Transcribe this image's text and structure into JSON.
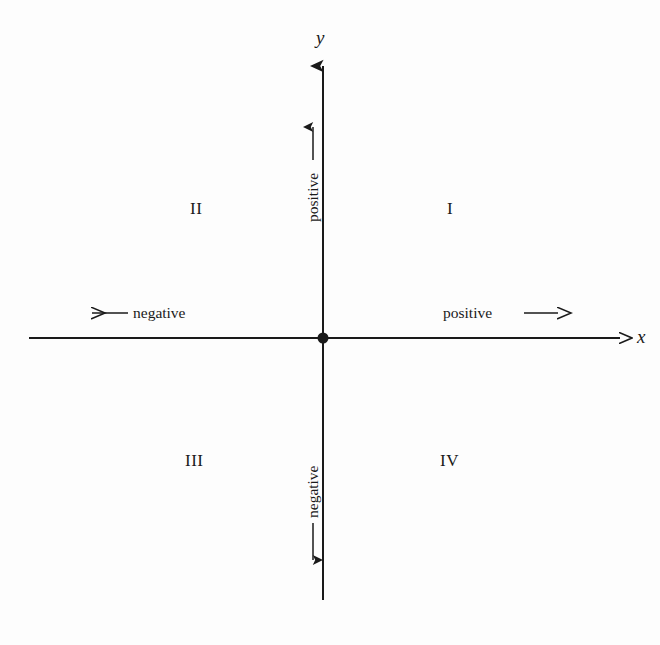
{
  "figure": {
    "type": "cartesian-coordinate-plane-diagram",
    "background_color": "#fdfdfd",
    "ink_color": "#1a1a1a"
  },
  "axes": {
    "x_label": "x",
    "y_label": "y",
    "origin_marker": "filled-dot"
  },
  "directions": {
    "x_negative": "negative",
    "x_positive": "positive",
    "y_positive": "positive",
    "y_negative": "negative"
  },
  "quadrants": [
    {
      "id": "I",
      "label": "I"
    },
    {
      "id": "II",
      "label": "II"
    },
    {
      "id": "III",
      "label": "III"
    },
    {
      "id": "IV",
      "label": "IV"
    }
  ]
}
